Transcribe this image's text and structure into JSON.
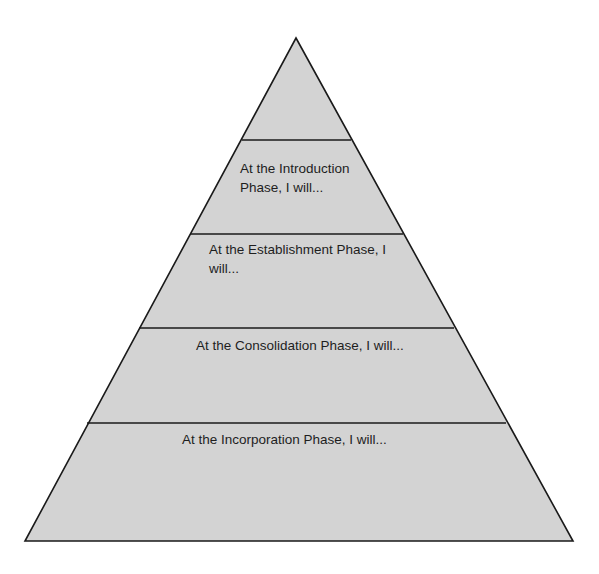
{
  "diagram": {
    "type": "pyramid",
    "fill_color": "#d3d3d3",
    "stroke_color": "#1a1a1a",
    "levels": [
      {
        "name": "apex",
        "label": ""
      },
      {
        "name": "introduction",
        "label": "At the Introduction Phase, I will..."
      },
      {
        "name": "establishment",
        "label": "At the Establishment Phase, I will..."
      },
      {
        "name": "consolidation",
        "label": "At the Consolidation Phase, I will..."
      },
      {
        "name": "incorporation",
        "label": "At the Incorporation Phase, I will..."
      }
    ]
  }
}
